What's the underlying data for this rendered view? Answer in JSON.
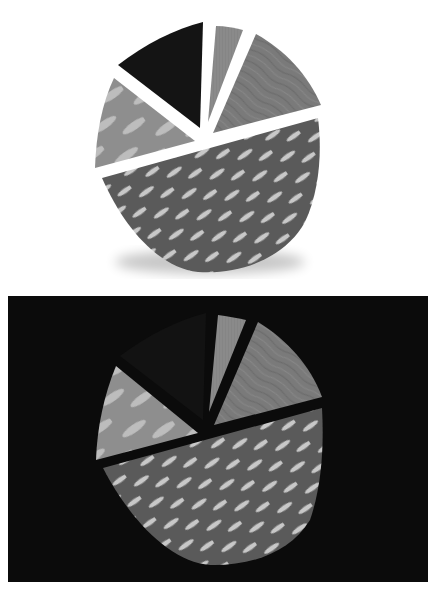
{
  "image": {
    "description": "Paper-craft style pie chart with five cut-out slices, shown on a white background and again on a black background",
    "mode": "grayscale"
  },
  "panels": [
    {
      "id": "top",
      "background": "#ffffff",
      "has_shadow": true,
      "label": "Pie chart on white background"
    },
    {
      "id": "bottom",
      "background": "#0b0b0b",
      "has_shadow": false,
      "label": "Pie chart on black background"
    }
  ],
  "slices": [
    {
      "name": "black-slice",
      "fill": "#141414",
      "texture": "solid"
    },
    {
      "name": "narrow-slice",
      "fill": "#8a8a8a",
      "texture": "solid"
    },
    {
      "name": "wood-slice",
      "fill": "#7a7a7a",
      "texture": "wood grain"
    },
    {
      "name": "left-slice",
      "fill": "#8e8e8e",
      "texture": "light ovals"
    },
    {
      "name": "large-bottom-slice",
      "fill": "#5a5a5a",
      "texture": "diagonal light ovals",
      "oval_color": "#c8c8c8"
    }
  ]
}
